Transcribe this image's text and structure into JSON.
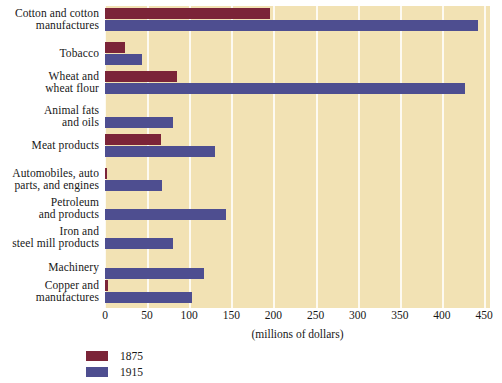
{
  "chart_data": {
    "type": "bar",
    "orientation": "horizontal",
    "title": "",
    "xlabel": "(millions of dollars)",
    "ylabel": "",
    "xlim": [
      0,
      450
    ],
    "xticks": [
      0,
      50,
      100,
      150,
      200,
      250,
      300,
      350,
      400,
      450
    ],
    "xtick_labels": [
      "0",
      "50",
      "100",
      "150",
      "200",
      "250",
      "300",
      "350",
      "400",
      "450"
    ],
    "grid": "vertical",
    "legend_position": "bottom-left",
    "categories": [
      "Cotton and cotton manufactures",
      "Tobacco",
      "Wheat and wheat flour",
      "Animal fats and oils",
      "Meat products",
      "Automobiles, auto parts, and engines",
      "Petroleum and products",
      "Iron and steel mill products",
      "Machinery",
      "Copper and manufactures"
    ],
    "category_label_lines": [
      [
        "Cotton and cotton",
        "manufactures"
      ],
      [
        "Tobacco"
      ],
      [
        "Wheat and",
        "wheat flour"
      ],
      [
        "Animal fats",
        "and oils"
      ],
      [
        "Meat products"
      ],
      [
        "Automobiles, auto",
        "parts, and engines"
      ],
      [
        "Petroleum",
        "and products"
      ],
      [
        "Iron and",
        "steel mill products"
      ],
      [
        "Machinery"
      ],
      [
        "Copper and",
        "manufactures"
      ]
    ],
    "series": [
      {
        "name": "1875",
        "color": "#7b2438",
        "values": [
          196,
          24,
          86,
          0,
          67,
          2,
          0,
          0,
          0,
          3
        ]
      },
      {
        "name": "1915",
        "color": "#4e4e90",
        "values": [
          443,
          44,
          428,
          81,
          131,
          68,
          144,
          81,
          117,
          103
        ]
      }
    ]
  },
  "colors": {
    "plot_background": "#f2e2b4",
    "gridline": "#fdfaf1",
    "page_background": "#ffffff",
    "text": "#171717"
  },
  "axis": {
    "x_title": "(millions of dollars)"
  },
  "legend": {
    "entries": [
      {
        "label": "1875",
        "color": "#7b2438"
      },
      {
        "label": "1915",
        "color": "#4e4e90"
      }
    ]
  }
}
